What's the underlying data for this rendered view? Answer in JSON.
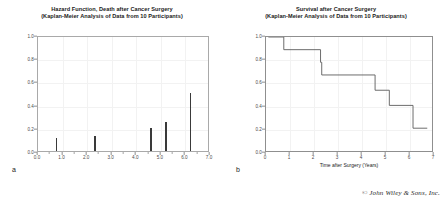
{
  "credit": "© John Wiley & Sons, Inc.",
  "panels": [
    {
      "letter": "a",
      "title_line1": "Hazard Function, Death after Cancer Surgery",
      "title_line2": "(Kaplan-Meier Analysis of Data from 10 Participants)"
    },
    {
      "letter": "b",
      "title_line1": "Survival after Cancer Surgery",
      "title_line2": "(Kaplan-Meier Analysis of Data from 10 Participants)"
    }
  ],
  "chart_data": [
    {
      "type": "bar",
      "title": "Hazard Function, Death after Cancer Surgery (Kaplan-Meier Analysis of Data from 10 Participants)",
      "xlabel": "",
      "ylabel": "Hazard (Probability of Death)",
      "xlim": [
        0.0,
        7.0
      ],
      "ylim": [
        0.0,
        1.0
      ],
      "xticks": [
        "0.0",
        "1.0",
        "2.0",
        "3.0",
        "4.0",
        "5.0",
        "6.0",
        "7.0"
      ],
      "xtick_values": [
        0.0,
        1.0,
        2.0,
        3.0,
        4.0,
        5.0,
        6.0,
        7.0
      ],
      "yticks": [
        "0.0",
        "0.2",
        "0.4",
        "0.6",
        "0.8",
        "1.0"
      ],
      "ytick_values": [
        0.0,
        0.2,
        0.4,
        0.6,
        0.8,
        1.0
      ],
      "grid": true,
      "legend": "none",
      "x": [
        0.75,
        2.3,
        2.35,
        4.6,
        5.2,
        6.2
      ],
      "values": [
        0.11,
        0.13,
        0.13,
        0.2,
        0.25,
        0.5
      ]
    },
    {
      "type": "line",
      "subtype": "step-post",
      "title": "Survival after Cancer Surgery (Kaplan-Meier Analysis of Data from 10 Participants)",
      "xlabel": "Time after Surgery (Years)",
      "ylabel": "Fraction of Population Surviving",
      "xlim": [
        0.0,
        7.0
      ],
      "ylim": [
        0.0,
        1.0
      ],
      "xticks": [
        "0",
        "1",
        "2",
        "3",
        "4",
        "5",
        "6",
        "7"
      ],
      "xtick_values": [
        0,
        1,
        2,
        3,
        4,
        5,
        6,
        7
      ],
      "yticks": [
        "0.0",
        "0.2",
        "0.4",
        "0.6",
        "0.8",
        "1.0"
      ],
      "ytick_values": [
        0.0,
        0.2,
        0.4,
        0.6,
        0.8,
        1.0
      ],
      "grid": true,
      "legend": "none",
      "series": [
        {
          "name": "Kaplan-Meier survival estimate",
          "x": [
            0.1,
            0.75,
            0.75,
            2.3,
            2.3,
            2.35,
            2.35,
            4.6,
            4.6,
            5.2,
            5.2,
            6.2,
            6.2,
            6.8
          ],
          "values": [
            1.0,
            1.0,
            0.889,
            0.889,
            0.778,
            0.778,
            0.667,
            0.667,
            0.533,
            0.533,
            0.4,
            0.4,
            0.2,
            0.2
          ]
        }
      ]
    }
  ]
}
